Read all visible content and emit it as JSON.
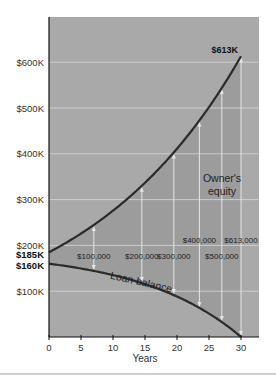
{
  "chart_data": {
    "type": "line",
    "title": "",
    "xlabel": "Years",
    "ylabel": "",
    "xlim": [
      0,
      33
    ],
    "ylim": [
      0,
      700
    ],
    "grid": true,
    "x_ticks": [
      0,
      5,
      10,
      15,
      20,
      25,
      30
    ],
    "x_tick_labels": [
      "0",
      "5",
      "10",
      "15",
      "20",
      "25",
      "30"
    ],
    "y_ticks": [
      100,
      200,
      300,
      400,
      500,
      600
    ],
    "y_tick_labels": [
      "$100K",
      "$200K",
      "$300K",
      "$400K",
      "$500K",
      "$600K"
    ],
    "y_special_labels": [
      {
        "value": 185,
        "label": "$185K"
      },
      {
        "value": 160,
        "label": "$160K"
      }
    ],
    "series": [
      {
        "name": "Home value",
        "x": [
          0,
          5,
          10,
          15,
          20,
          25,
          30
        ],
        "values": [
          185,
          224,
          272,
          330,
          400,
          495,
          613
        ]
      },
      {
        "name": "Loan balance",
        "x": [
          0,
          5,
          10,
          15,
          20,
          25,
          30
        ],
        "values": [
          160,
          150,
          136,
          116,
          88,
          50,
          0
        ]
      }
    ],
    "annotations": [
      {
        "text": "$613K",
        "x": 30,
        "y": 613,
        "bold": true
      },
      {
        "text": "$100,000",
        "x": 7,
        "type": "equity-arrow"
      },
      {
        "text": "$200,000",
        "x": 14.5,
        "type": "equity-arrow"
      },
      {
        "text": "$300,000",
        "x": 19.5,
        "type": "equity-arrow"
      },
      {
        "text": "$400,000",
        "x": 23.5,
        "type": "equity-arrow"
      },
      {
        "text": "$500,000",
        "x": 27,
        "type": "equity-arrow"
      },
      {
        "text": "$613,000",
        "x": 30,
        "type": "equity-arrow"
      }
    ],
    "region_labels": [
      "Owner's equity",
      "Loan balance"
    ],
    "legend": "none"
  },
  "labels": {
    "peak": "$613K",
    "owner_line1": "Owner's",
    "owner_line2": "equity",
    "loan": "Loan balance",
    "xaxis": "Years",
    "y185": "$185K",
    "y160": "$160K"
  },
  "colors": {
    "plot_bg": "#a9a9a9",
    "equity_fill": "#9c9c9c",
    "curve": "#2b2b2b",
    "grid": "#d8d8d8",
    "arrow": "#e6e6e6"
  }
}
